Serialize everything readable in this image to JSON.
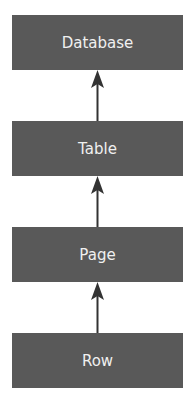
{
  "diagram": {
    "nodes": [
      {
        "id": "database",
        "label": "Database"
      },
      {
        "id": "table",
        "label": "Table"
      },
      {
        "id": "page",
        "label": "Page"
      },
      {
        "id": "row",
        "label": "Row"
      }
    ],
    "edges": [
      {
        "from": "table",
        "to": "database"
      },
      {
        "from": "page",
        "to": "table"
      },
      {
        "from": "row",
        "to": "page"
      }
    ],
    "colors": {
      "box": "#595959",
      "text": "#f0f0f0",
      "arrow": "#333333"
    }
  }
}
